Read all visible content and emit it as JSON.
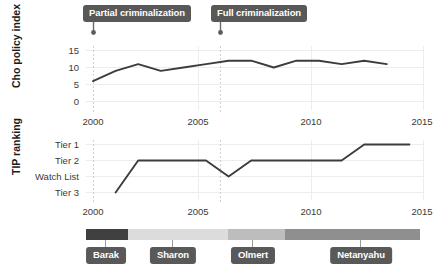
{
  "chart_data": [
    {
      "type": "line",
      "title": "",
      "xlabel": "",
      "ylabel": "Cho policy index",
      "xlim": [
        1999,
        2015
      ],
      "ylim": [
        0,
        16
      ],
      "xticks": [
        "2000",
        "2005",
        "2010",
        "2015"
      ],
      "xtick_values": [
        2000,
        2005,
        2010,
        2015
      ],
      "yticks": [
        "0",
        "5",
        "10",
        "15"
      ],
      "ytick_values": [
        0,
        5,
        10,
        15
      ],
      "grid": true,
      "legend": "none",
      "x": [
        2000,
        2001,
        2002,
        2003,
        2004,
        2005,
        2006,
        2007,
        2008,
        2009,
        2010,
        2011,
        2012,
        2013
      ],
      "values": [
        6,
        9,
        11,
        9,
        10,
        11,
        12,
        12,
        10,
        12,
        12,
        11,
        12,
        11
      ],
      "annotations": [
        {
          "label": "Partial criminalization",
          "x": 2000
        },
        {
          "label": "Full criminalization",
          "x": 2006
        }
      ]
    },
    {
      "type": "line",
      "title": "",
      "xlabel": "",
      "ylabel": "TIP ranking",
      "xlim": [
        1999,
        2015
      ],
      "xticks": [
        "2000",
        "2005",
        "2010",
        "2015"
      ],
      "xtick_values": [
        2000,
        2005,
        2010,
        2015
      ],
      "yticks": [
        "Tier 1",
        "Tier 2",
        "Watch List",
        "Tier 3"
      ],
      "ytick_values": [
        4,
        3,
        2,
        1
      ],
      "grid": true,
      "legend": "none",
      "x": [
        2001,
        2002,
        2003,
        2004,
        2005,
        2006,
        2007,
        2008,
        2009,
        2010,
        2011,
        2012,
        2013,
        2014
      ],
      "values": [
        1,
        3,
        3,
        3,
        3,
        2,
        3,
        3,
        3,
        3,
        3,
        4,
        4,
        4
      ],
      "value_labels": [
        "Tier 3",
        "Tier 2",
        "Tier 2",
        "Tier 2",
        "Tier 2",
        "Watch List",
        "Tier 2",
        "Tier 2",
        "Tier 2",
        "Tier 2",
        "Tier 2",
        "Tier 1",
        "Tier 1",
        "Tier 1"
      ],
      "annotations": [
        {
          "label": "Partial criminalization",
          "x": 2000
        },
        {
          "label": "Full criminalization",
          "x": 2006
        }
      ]
    },
    {
      "type": "timeline",
      "title": "",
      "xlim": [
        1999,
        2015
      ],
      "segments": [
        {
          "label": "Barak",
          "start": 1999.0,
          "end": 2001.0,
          "color": "#404040"
        },
        {
          "label": "Sharon",
          "start": 2001.0,
          "end": 2006.0,
          "color": "#dcdcdc"
        },
        {
          "label": "Olmert",
          "start": 2006.0,
          "end": 2009.0,
          "color": "#bdbdbd"
        },
        {
          "label": "Netanyahu",
          "start": 2009.0,
          "end": 2015.0,
          "color": "#8f8f8f"
        }
      ]
    }
  ],
  "annotations": {
    "partial": "Partial criminalization",
    "full": "Full criminalization"
  },
  "axes": {
    "top_ylabel": "Cho policy index",
    "bottom_ylabel": "TIP ranking"
  },
  "colors": {
    "line": "#3c3c3c",
    "grid": "#ededed",
    "event_line": "#d2d2d2",
    "callout_bg": "#585858",
    "callout_text": "#ffffff"
  }
}
